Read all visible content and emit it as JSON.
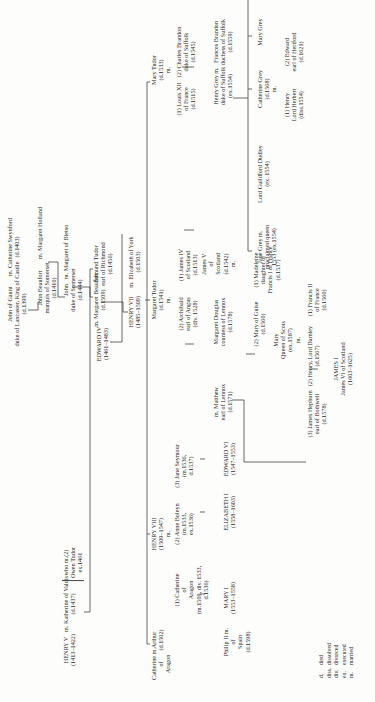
{
  "diagram": {
    "nodes": {
      "john_of_gaunt": {
        "name": "John of Gaunt",
        "line2": "duke of Lancaster, King of Castile",
        "dates": "(d.1399)"
      },
      "catherine_swynford": {
        "name": "m. Catherine Swynford",
        "dates": "(d.1403)"
      },
      "john_beaufort": {
        "name": "John Beaufort",
        "line2": "marquis of Somerset",
        "dates": "(d.1410)"
      },
      "margaret_holland": {
        "name": "m. Margaret Holland"
      },
      "john_somerset": {
        "name": "John",
        "line2": "duke of Somerset",
        "dates": "(d.1444)"
      },
      "margaret_bletso": {
        "name": "m. Margaret of Bletso"
      },
      "henry_v": {
        "name": "HENRY V",
        "dates": "(1413–1422)"
      },
      "katherine_valois": {
        "name": "m. Katherine of Valois",
        "dates": "(d.1437)"
      },
      "owen_tudor": {
        "name": "who m.(2)",
        "line2": "Owen Tudor",
        "dates": "ex.1461"
      },
      "edmund_tudor": {
        "name": "Edmund Tudor",
        "line2": "earl of Richmond",
        "dates": "(d.1456)"
      },
      "margaret_beaufort": {
        "name": "m. Margaret Beaufort",
        "dates": "(d.1509)"
      },
      "edward_iv": {
        "name": "EDWARD IV",
        "dates": "(1461–1483)"
      },
      "henry_vii": {
        "name": "HENRY VII",
        "dates": "(1485–1509)"
      },
      "elizabeth_york": {
        "name": "m. Elizabeth of York",
        "dates": "(d.1503)"
      },
      "catherine_aragon_a": {
        "name": "Catherine m.",
        "line2": "of",
        "dates": "Aragon"
      },
      "arthur": {
        "name": "Arthur",
        "dates": "(d.1502)"
      },
      "henry_viii": {
        "name": "HENRY VIII",
        "dates": "(1509–1547)",
        "marker": "m."
      },
      "catherine_aragon_h": {
        "name": "(1) Catherine",
        "line2": "of",
        "line3": "Aragon",
        "line4": "(m.1509, div. 1533,",
        "dates": "d.1536)"
      },
      "anne_boleyn": {
        "name": "(2) Anne Boleyn",
        "line2": "(m.1533,",
        "dates": "ex.1536)"
      },
      "jane_seymour": {
        "name": "(3) Jane Seymour",
        "line2": "(m.1536,",
        "dates": "d.1537)"
      },
      "philip_ii": {
        "name": "Philip II m.",
        "line2": "of",
        "line3": "Spain",
        "dates": "(d.1598)"
      },
      "mary_i": {
        "name": "MARY I",
        "dates": "(1553–1558)"
      },
      "elizabeth_i": {
        "name": "ELIZABETH I",
        "dates": "(1558–1603)"
      },
      "edward_vi": {
        "name": "EDWARD VI",
        "dates": "(1547–1553)"
      },
      "margaret_tudor": {
        "name": "Margaret Tudor",
        "dates": "(d.1541)",
        "marker": "m."
      },
      "james_iv": {
        "name": "(1) James IV",
        "line2": "of Scotland",
        "dates": "(d.1513)"
      },
      "archibald": {
        "name": "(2) Archibald",
        "line2": "earl of Angus",
        "dates": "(div. 1528)"
      },
      "james_v": {
        "name": "James V",
        "line2": "of",
        "line3": "Scotland",
        "dates": "(d.1542)",
        "marker": "m."
      },
      "margaret_douglas": {
        "name": "Margaret Douglas",
        "line2": "countess of Lennox",
        "dates": "(d.1578)"
      },
      "matthew": {
        "name": "m. Matthew",
        "line2": "earl of Lennox",
        "dates": "(d.1571)"
      },
      "madeleine": {
        "name": "(1) Madeleine",
        "line2": "daughter of",
        "line3": "Francis I of France",
        "dates": "(d.1537)"
      },
      "mary_guise": {
        "name": "(2) Mary of Guise",
        "dates": "(d.1560)"
      },
      "mary_qos": {
        "name": "Mary",
        "line2": "Queen of Scots",
        "dates": "(ex.1587)",
        "marker": "m."
      },
      "francis_ii": {
        "name": "(1) Francis II",
        "line2": "of France",
        "dates": "(d.1560)"
      },
      "darnley": {
        "name": "(2) Henry, Lord Darnley",
        "dates": "(d.1567)"
      },
      "bothwell": {
        "name": "(3) James Hepburn",
        "line2": "earl of Bothwell",
        "dates": "(d.1578)"
      },
      "james_i": {
        "name": "JAMES I",
        "line2": "James VI of Scotland",
        "dates": "(1603–1625)"
      },
      "mary_tudor": {
        "name": "Mary Tudor",
        "dates": "(d.1533)",
        "marker": "m."
      },
      "louis_xii": {
        "name": "(1) Louis XII",
        "line2": "of France",
        "dates": "(d.1515)"
      },
      "charles_brandon": {
        "name": "(2) Charles Brandon",
        "line2": "duke of Suffolk",
        "dates": "(d.1545)"
      },
      "henry_grey": {
        "name": "Henry Grey m.",
        "line2": "duke of Suffolk",
        "dates": "(ex.1554)"
      },
      "frances_brandon": {
        "name": "Frances Brandon",
        "line2": "duchess of Suffolk",
        "dates": "(d.1559)"
      },
      "jane_grey": {
        "name": "Jane Grey m.",
        "line2": "proclaimed queen",
        "dates": "1553 (ex.1554)"
      },
      "guildford": {
        "name": "Lord Guildford Dudley",
        "dates": "(ex. 1554)"
      },
      "catherine_grey": {
        "name": "Catherine Grey",
        "dates": "(d.1568)",
        "marker": "m."
      },
      "henry_herbert": {
        "name": "(1) Henry",
        "line2": "Lord Herbert",
        "dates": "(diss.1554)"
      },
      "edward_hertford": {
        "name": "(2) Edward",
        "line2": "earl of Hertford",
        "dates": "(d.1621)"
      },
      "mary_grey": {
        "name": "Mary Grey"
      }
    },
    "legend": [
      {
        "abbr": "d.",
        "meaning": "died"
      },
      {
        "abbr": "diss.",
        "meaning": "dissolved"
      },
      {
        "abbr": "div.",
        "meaning": "divorced"
      },
      {
        "abbr": "ex.",
        "meaning": "executed"
      },
      {
        "abbr": "m.",
        "meaning": "married"
      }
    ]
  }
}
